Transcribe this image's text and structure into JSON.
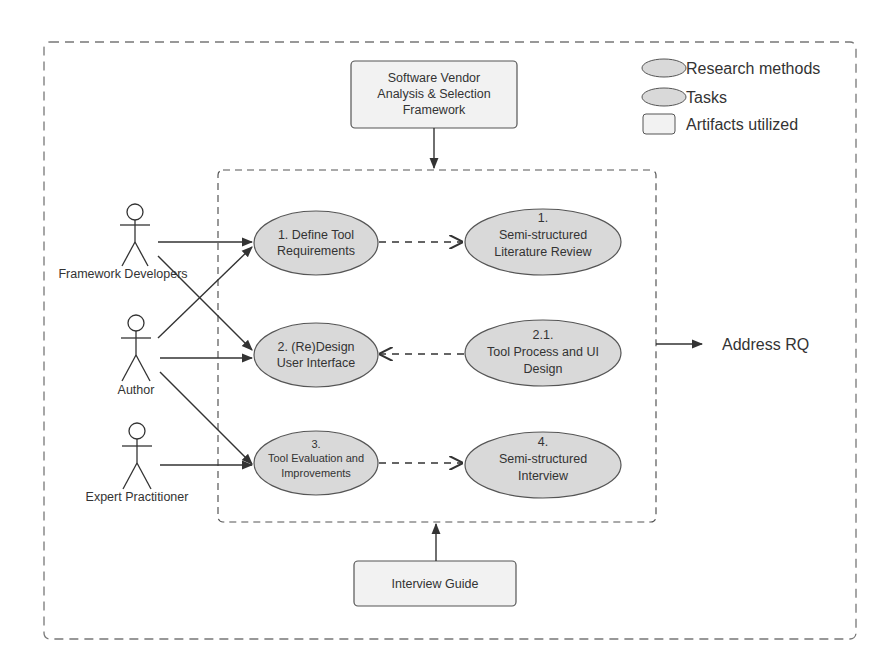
{
  "legend": {
    "items": [
      {
        "shape": "ellipse",
        "label": "Research methods"
      },
      {
        "shape": "ellipse",
        "label": "Tasks"
      },
      {
        "shape": "rect",
        "label": "Artifacts utilized"
      }
    ]
  },
  "artifacts": {
    "top": [
      "Software Vendor",
      "Analysis & Selection",
      "Framework"
    ],
    "bottom": [
      "Interview Guide"
    ]
  },
  "actors": [
    {
      "id": "framework-developers",
      "label": "Framework Developers"
    },
    {
      "id": "author",
      "label": "Author"
    },
    {
      "id": "expert-practitioner",
      "label": "Expert Practitioner"
    }
  ],
  "tasks": [
    {
      "id": "task-1",
      "lines": [
        "1. Define Tool",
        "Requirements"
      ]
    },
    {
      "id": "task-2",
      "lines": [
        "2. (Re)Design",
        "User Interface"
      ]
    },
    {
      "id": "task-3",
      "lines": [
        "3.",
        "Tool Evaluation and",
        "Improvements"
      ]
    }
  ],
  "methods": [
    {
      "id": "method-1",
      "lines": [
        "1.",
        "Semi-structured",
        "Literature Review"
      ]
    },
    {
      "id": "method-2-1",
      "lines": [
        "2.1.",
        "Tool Process and UI",
        "Design"
      ]
    },
    {
      "id": "method-4",
      "lines": [
        "4.",
        "Semi-structured",
        "Interview"
      ]
    }
  ],
  "output": {
    "label": "Address RQ"
  },
  "colors": {
    "ellipse_fill": "#d9d9d9",
    "artifact_fill": "#f2f2f2",
    "stroke": "#333333",
    "dashed_border": "#777777"
  }
}
